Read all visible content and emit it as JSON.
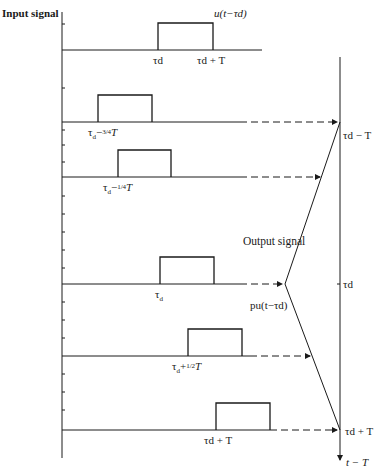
{
  "title": "Input signal",
  "input_label": "u(t−τd)",
  "output_title": "Output signal",
  "output_label": "pu(t−τd)",
  "time_axis_label": "t − T",
  "rows": [
    {
      "label": "τd",
      "end_label": "τd + T",
      "note": "input"
    },
    {
      "label": "τd − 3/4 T"
    },
    {
      "label": "τd − 1/4 T"
    },
    {
      "label": "τd"
    },
    {
      "label": "τd + 1/2 T"
    },
    {
      "label": "τd + T"
    }
  ],
  "right_axis_labels": {
    "top": "τd − T",
    "middle": "τd",
    "bottom": "τd + T"
  },
  "colors": {
    "ink": "#1a1a1a",
    "background": "#ffffff"
  }
}
